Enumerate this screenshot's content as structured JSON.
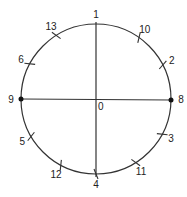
{
  "diagram": {
    "center": {
      "x": 96,
      "y": 99,
      "label": "0"
    },
    "radius": 75,
    "line_color": "#333333",
    "points": [
      {
        "label": "1",
        "angle": 90,
        "tick": false
      },
      {
        "label": "10",
        "angle": 55,
        "tick": true
      },
      {
        "label": "2",
        "angle": 27,
        "tick": true
      },
      {
        "label": "8",
        "angle": 0,
        "tick": false,
        "dot": true
      },
      {
        "label": "3",
        "angle": -28,
        "tick": true
      },
      {
        "label": "11",
        "angle": -58,
        "tick": true
      },
      {
        "label": "4",
        "angle": -90,
        "tick": true
      },
      {
        "label": "12",
        "angle": -118,
        "tick": true
      },
      {
        "label": "5",
        "angle": -150,
        "tick": true
      },
      {
        "label": "9",
        "angle": 180,
        "tick": false,
        "dot": true
      },
      {
        "label": "6",
        "angle": 152,
        "tick": true
      },
      {
        "label": "13",
        "angle": 122,
        "tick": true
      }
    ]
  }
}
